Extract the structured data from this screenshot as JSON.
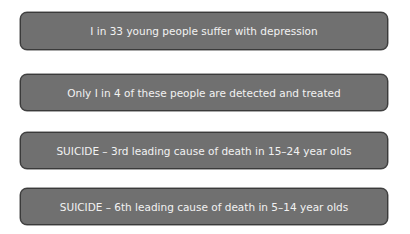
{
  "diagram": {
    "boxes": [
      {
        "text": "I in 33 young people suffer with depression"
      },
      {
        "text": "Only I in 4 of these people are detected and treated"
      },
      {
        "text": "SUICIDE – 3rd leading cause of death in 15–24 year olds"
      },
      {
        "text": "SUICIDE – 6th leading cause of death in 5–14 year olds"
      }
    ],
    "colors": {
      "box_fill": "#707070",
      "box_border": "#3a3a3a",
      "text": "#f2f2f2",
      "background": "#ffffff"
    }
  }
}
